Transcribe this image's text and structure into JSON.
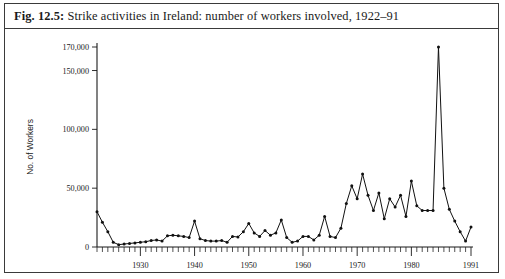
{
  "figure": {
    "number_label": "Fig. 12.5:",
    "caption_text": "Strike activities in Ireland: number of workers involved, 1922–91"
  },
  "chart_data": {
    "type": "line",
    "title": "Strike activities in Ireland: number of workers involved, 1922–91",
    "xlabel": "",
    "ylabel": "No. of Workers",
    "xlim": [
      1922,
      1991
    ],
    "ylim": [
      0,
      170000
    ],
    "grid": false,
    "legend": null,
    "markers": "filled-circle",
    "y_ticks": [
      0,
      50000,
      100000,
      150000,
      170000
    ],
    "y_ticklabels": [
      "0",
      "50,000",
      "100,000",
      "150,000",
      "170,000"
    ],
    "x_ticks": [
      1930,
      1940,
      1950,
      1960,
      1970,
      1980,
      1991
    ],
    "x_ticklabels": [
      "1930",
      "1940",
      "1950",
      "1960",
      "1970",
      "1980",
      "1991"
    ],
    "x_minor_tick_interval": 1,
    "series": [
      {
        "name": "No. of workers involved",
        "x": [
          1922,
          1923,
          1924,
          1925,
          1926,
          1927,
          1928,
          1929,
          1930,
          1931,
          1932,
          1933,
          1934,
          1935,
          1936,
          1937,
          1938,
          1939,
          1940,
          1941,
          1942,
          1943,
          1944,
          1945,
          1946,
          1947,
          1948,
          1949,
          1950,
          1951,
          1952,
          1953,
          1954,
          1955,
          1956,
          1957,
          1958,
          1959,
          1960,
          1961,
          1962,
          1963,
          1964,
          1965,
          1966,
          1967,
          1968,
          1969,
          1970,
          1971,
          1972,
          1973,
          1974,
          1975,
          1976,
          1977,
          1978,
          1979,
          1980,
          1981,
          1982,
          1983,
          1984,
          1985,
          1986,
          1987,
          1988,
          1989,
          1990,
          1991
        ],
        "values": [
          30000,
          21000,
          13000,
          4000,
          2000,
          2500,
          3000,
          3500,
          4000,
          4500,
          5500,
          6000,
          5000,
          9500,
          10000,
          9500,
          9000,
          8000,
          22000,
          7000,
          5500,
          5000,
          5000,
          5500,
          4000,
          9000,
          8500,
          13000,
          20000,
          12000,
          9000,
          14000,
          10000,
          12000,
          23000,
          8000,
          4000,
          5000,
          9000,
          9000,
          6000,
          10000,
          26000,
          9000,
          8000,
          16000,
          37000,
          52000,
          41000,
          62000,
          44000,
          31000,
          46000,
          24000,
          41000,
          34000,
          44000,
          26000,
          56000,
          35000,
          31000,
          31000,
          31000,
          170000,
          50000,
          32000,
          22000,
          13000,
          5000,
          17000
        ]
      }
    ]
  }
}
